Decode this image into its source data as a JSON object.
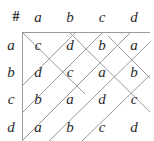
{
  "table": {
    "corner_symbol": "#",
    "column_headers": [
      "a",
      "b",
      "c",
      "d"
    ],
    "row_headers": [
      "a",
      "b",
      "c",
      "d"
    ],
    "rows": [
      [
        "c",
        "d",
        "b",
        "a"
      ],
      [
        "d",
        "c",
        "a",
        "b"
      ],
      [
        "b",
        "a",
        "d",
        "c"
      ],
      [
        "a",
        "b",
        "c",
        "d"
      ]
    ]
  },
  "annotations": {
    "line_color": "#9a9a9a",
    "text_color": "#2b2b2b",
    "diagonal_lines": [
      {
        "name": "ascend-1",
        "x1": 0,
        "y1": 54,
        "x2": 54,
        "y2": 0
      },
      {
        "name": "ascend-2",
        "x1": 0,
        "y1": 81,
        "x2": 81,
        "y2": 0
      },
      {
        "name": "ascend-3",
        "x1": 0,
        "y1": 109,
        "x2": 109,
        "y2": 0
      },
      {
        "name": "ascend-4",
        "x1": 27,
        "y1": 109,
        "x2": 128,
        "y2": 10
      },
      {
        "name": "ascend-5",
        "x1": 60,
        "y1": 109,
        "x2": 128,
        "y2": 43
      },
      {
        "name": "descend-1",
        "x1": 0,
        "y1": 0,
        "x2": 63,
        "y2": 62
      },
      {
        "name": "descend-2",
        "x1": 47,
        "y1": 0,
        "x2": 128,
        "y2": 80
      },
      {
        "name": "descend-3",
        "x1": 86,
        "y1": 4,
        "x2": 128,
        "y2": 46
      }
    ]
  }
}
